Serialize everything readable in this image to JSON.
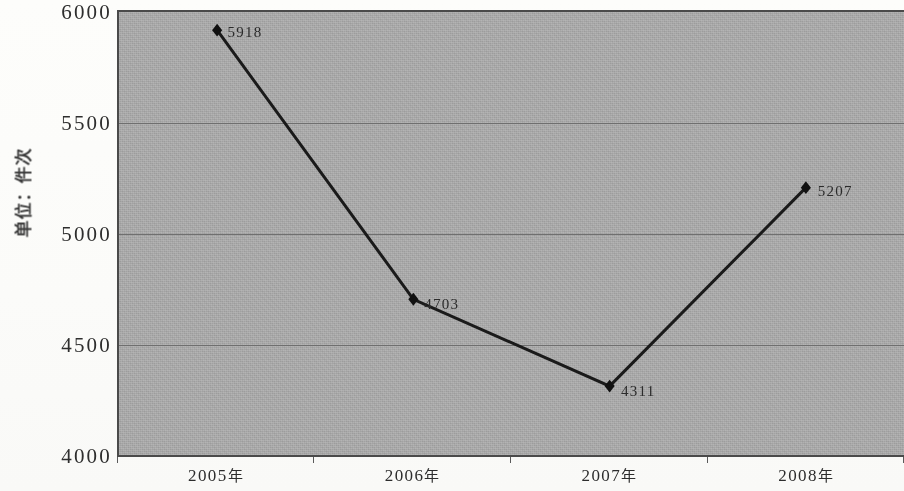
{
  "chart_data": {
    "type": "line",
    "title": "",
    "subtitle": "",
    "xlabel": "",
    "ylabel": "单位：件次",
    "categories": [
      "2005年",
      "2006年",
      "2007年",
      "2008年"
    ],
    "values": [
      5918,
      4703,
      4311,
      5207
    ],
    "point_labels": [
      "5918",
      "4703",
      "4311",
      "5207"
    ],
    "ylim": [
      4000,
      6000
    ],
    "ytick_labels": [
      "6000",
      "5500",
      "5000",
      "4500",
      "4000"
    ],
    "ytick_values": [
      6000,
      5500,
      5000,
      4500,
      4000
    ],
    "ystep": 500,
    "gridlines": [
      5500,
      5000,
      4500
    ],
    "grid": true,
    "legend": null,
    "legend_position": "none",
    "series": [
      {
        "name": "件次",
        "values": [
          5918,
          4703,
          4311,
          5207
        ],
        "marker": "diamond",
        "marker_color": "#111111",
        "line_color": "#1a1a1a"
      }
    ],
    "colors": {
      "plot_background": "#a7a7a7",
      "line": "#1a1a1a",
      "marker": "#111111",
      "gridline": "#6f6f6f",
      "axis": "#4a4a4a",
      "text": "#2d2d2d",
      "page_background": "#fbfbf9"
    }
  }
}
